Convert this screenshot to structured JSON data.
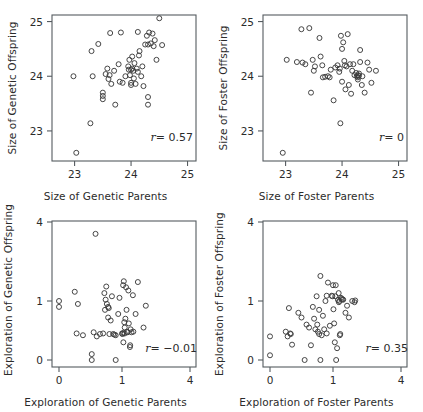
{
  "figure": {
    "kind": "scatterplot-matrix",
    "panel_count": 4,
    "marker": "open-circle",
    "marker_color": "#3c3c3c",
    "axis_color": "#555b60",
    "background": "#ffffff"
  },
  "chart_data": [
    {
      "id": "genetic-size",
      "position": "top-left",
      "type": "scatter",
      "title": "",
      "xlabel": "Size of Genetic Parents",
      "ylabel": "Size of Genetic Offspring",
      "annotation_r_symbol": "r",
      "annotation_r_value": "= 0.57",
      "r": 0.57,
      "grid": false,
      "legend": "none",
      "xticks": [
        23,
        24,
        25
      ],
      "yticks": [
        23,
        24,
        25
      ],
      "xlim": [
        22.6,
        25.15
      ],
      "ylim": [
        22.45,
        25.12
      ],
      "x_scale": "linear",
      "y_scale": "linear",
      "points": [
        [
          22.98,
          24.0
        ],
        [
          23.03,
          22.6
        ],
        [
          23.28,
          23.14
        ],
        [
          23.3,
          24.46
        ],
        [
          23.32,
          24.0
        ],
        [
          23.42,
          24.59
        ],
        [
          23.5,
          23.7
        ],
        [
          23.5,
          23.64
        ],
        [
          23.5,
          23.58
        ],
        [
          23.55,
          24.04
        ],
        [
          23.58,
          24.14
        ],
        [
          23.6,
          23.95
        ],
        [
          23.62,
          24.02
        ],
        [
          23.63,
          24.79
        ],
        [
          23.65,
          23.86
        ],
        [
          23.7,
          24.1
        ],
        [
          23.72,
          23.48
        ],
        [
          23.78,
          24.22
        ],
        [
          23.8,
          23.9
        ],
        [
          23.82,
          24.8
        ],
        [
          23.85,
          23.88
        ],
        [
          23.9,
          24.0
        ],
        [
          23.95,
          24.18
        ],
        [
          23.96,
          24.12
        ],
        [
          23.97,
          24.3
        ],
        [
          23.98,
          24.02
        ],
        [
          24.0,
          24.12
        ],
        [
          24.0,
          23.88
        ],
        [
          24.0,
          23.84
        ],
        [
          24.02,
          24.36
        ],
        [
          24.02,
          24.14
        ],
        [
          24.04,
          24.1
        ],
        [
          24.05,
          23.96
        ],
        [
          24.06,
          24.24
        ],
        [
          24.08,
          23.86
        ],
        [
          24.1,
          24.14
        ],
        [
          24.12,
          24.08
        ],
        [
          24.12,
          24.81
        ],
        [
          24.15,
          24.46
        ],
        [
          24.18,
          24.0
        ],
        [
          24.2,
          24.18
        ],
        [
          24.22,
          23.82
        ],
        [
          24.25,
          24.58
        ],
        [
          24.28,
          24.74
        ],
        [
          24.3,
          24.58
        ],
        [
          24.3,
          23.62
        ],
        [
          24.3,
          23.48
        ],
        [
          24.32,
          24.8
        ],
        [
          24.35,
          24.6
        ],
        [
          24.38,
          24.78
        ],
        [
          24.4,
          24.55
        ],
        [
          24.42,
          24.66
        ],
        [
          24.45,
          24.3
        ],
        [
          24.5,
          25.06
        ],
        [
          24.55,
          24.57
        ],
        [
          24.14,
          24.38
        ]
      ]
    },
    {
      "id": "foster-size",
      "position": "top-right",
      "type": "scatter",
      "title": "",
      "xlabel": "Size of Foster Parents",
      "ylabel": "Size of Foster Offspring",
      "annotation_r_symbol": "r",
      "annotation_r_value": "= 0",
      "r": 0.0,
      "grid": false,
      "legend": "none",
      "xticks": [
        23,
        24,
        25
      ],
      "yticks": [
        23,
        24,
        25
      ],
      "xlim": [
        22.6,
        25.15
      ],
      "ylim": [
        22.45,
        25.12
      ],
      "x_scale": "linear",
      "y_scale": "linear",
      "points": [
        [
          22.95,
          22.6
        ],
        [
          23.02,
          24.3
        ],
        [
          23.2,
          24.26
        ],
        [
          23.28,
          24.86
        ],
        [
          23.3,
          24.25
        ],
        [
          23.35,
          24.22
        ],
        [
          23.42,
          24.88
        ],
        [
          23.45,
          23.7
        ],
        [
          23.48,
          24.3
        ],
        [
          23.5,
          24.1
        ],
        [
          23.52,
          24.18
        ],
        [
          23.6,
          24.7
        ],
        [
          23.62,
          24.36
        ],
        [
          23.65,
          24.2
        ],
        [
          23.66,
          23.98
        ],
        [
          23.7,
          23.99
        ],
        [
          23.75,
          24.0
        ],
        [
          23.78,
          23.98
        ],
        [
          23.8,
          24.12
        ],
        [
          23.85,
          23.56
        ],
        [
          23.88,
          24.16
        ],
        [
          23.92,
          24.2
        ],
        [
          23.95,
          24.08
        ],
        [
          23.96,
          24.14
        ],
        [
          23.97,
          23.14
        ],
        [
          23.98,
          24.74
        ],
        [
          24.0,
          24.5
        ],
        [
          24.0,
          23.9
        ],
        [
          24.02,
          24.62
        ],
        [
          24.04,
          24.28
        ],
        [
          24.05,
          24.2
        ],
        [
          24.06,
          23.76
        ],
        [
          24.08,
          24.18
        ],
        [
          24.1,
          24.77
        ],
        [
          24.12,
          23.84
        ],
        [
          24.14,
          24.22
        ],
        [
          24.16,
          23.68
        ],
        [
          24.18,
          24.1
        ],
        [
          24.2,
          24.22
        ],
        [
          24.22,
          24.02
        ],
        [
          24.25,
          24.06
        ],
        [
          24.26,
          24.0
        ],
        [
          24.28,
          24.02
        ],
        [
          24.28,
          23.94
        ],
        [
          24.3,
          24.05
        ],
        [
          24.3,
          24.01
        ],
        [
          24.32,
          24.48
        ],
        [
          24.32,
          24.26
        ],
        [
          24.35,
          23.84
        ],
        [
          24.36,
          24.0
        ],
        [
          24.4,
          23.7
        ],
        [
          24.45,
          24.25
        ],
        [
          24.48,
          24.12
        ],
        [
          24.52,
          23.88
        ],
        [
          24.6,
          24.1
        ],
        [
          24.28,
          23.98
        ]
      ]
    },
    {
      "id": "genetic-exploration",
      "position": "bottom-left",
      "type": "scatter",
      "title": "",
      "xlabel": "Exploration of Genetic Parents",
      "ylabel": "Exploration of Genetic Offspring",
      "annotation_r_symbol": "r",
      "annotation_r_value": "= −0.01",
      "r": -0.01,
      "grid": false,
      "legend": "none",
      "xticks": [
        0,
        1,
        4
      ],
      "yticks": [
        0,
        1,
        4
      ],
      "xlim": [
        -0.12,
        4.35
      ],
      "ylim": [
        -0.12,
        4.3
      ],
      "x_scale": "sqrt-like",
      "y_scale": "sqrt-like",
      "points": [
        [
          0.0,
          1.0
        ],
        [
          0.0,
          0.9
        ],
        [
          0.25,
          1.35
        ],
        [
          0.3,
          0.95
        ],
        [
          0.28,
          0.45
        ],
        [
          0.38,
          0.42
        ],
        [
          0.52,
          0.1
        ],
        [
          0.52,
          0.0
        ],
        [
          0.55,
          0.47
        ],
        [
          0.58,
          3.55
        ],
        [
          0.6,
          0.4
        ],
        [
          0.65,
          0.44
        ],
        [
          0.7,
          0.45
        ],
        [
          0.72,
          1.3
        ],
        [
          0.74,
          1.05
        ],
        [
          0.75,
          1.55
        ],
        [
          0.76,
          0.95
        ],
        [
          0.78,
          0.9
        ],
        [
          0.78,
          0.72
        ],
        [
          0.8,
          0.44
        ],
        [
          0.82,
          0.67
        ],
        [
          0.84,
          1.18
        ],
        [
          0.86,
          0.44
        ],
        [
          0.88,
          0.43
        ],
        [
          0.9,
          0.42
        ],
        [
          0.9,
          0.0
        ],
        [
          0.94,
          0.78
        ],
        [
          0.96,
          1.12
        ],
        [
          1.0,
          0.45
        ],
        [
          1.02,
          0.44
        ],
        [
          1.05,
          1.6
        ],
        [
          1.06,
          0.3
        ],
        [
          1.08,
          1.75
        ],
        [
          1.1,
          0.64
        ],
        [
          1.12,
          0.55
        ],
        [
          1.15,
          0.7
        ],
        [
          1.18,
          1.52
        ],
        [
          1.2,
          0.85
        ],
        [
          1.22,
          0.48
        ],
        [
          1.25,
          0.47
        ],
        [
          1.28,
          1.4
        ],
        [
          1.3,
          0.62
        ],
        [
          1.35,
          0.22
        ],
        [
          1.36,
          0.25
        ],
        [
          1.38,
          0.52
        ],
        [
          1.42,
          0.47
        ],
        [
          1.48,
          1.22
        ],
        [
          1.5,
          0.48
        ],
        [
          1.6,
          0.78
        ],
        [
          1.7,
          1.72
        ],
        [
          1.95,
          0.55
        ],
        [
          2.05,
          0.92
        ],
        [
          0.73,
          0.85
        ],
        [
          0.79,
          0.88
        ],
        [
          1.12,
          0.45
        ],
        [
          1.06,
          0.46
        ]
      ]
    },
    {
      "id": "foster-exploration",
      "position": "bottom-right",
      "type": "scatter",
      "title": "",
      "xlabel": "Exploration of Foster Parents",
      "ylabel": "Exploration of Foster Offspring",
      "annotation_r_symbol": "r",
      "annotation_r_value": "= 0.35",
      "r": 0.35,
      "grid": false,
      "legend": "none",
      "xticks": [
        0,
        1,
        4
      ],
      "yticks": [
        0,
        1,
        4
      ],
      "xlim": [
        -0.12,
        4.35
      ],
      "ylim": [
        -0.12,
        4.3
      ],
      "x_scale": "sqrt-like",
      "y_scale": "sqrt-like",
      "points": [
        [
          0.0,
          0.4
        ],
        [
          0.0,
          0.08
        ],
        [
          0.25,
          0.48
        ],
        [
          0.28,
          0.4
        ],
        [
          0.3,
          0.88
        ],
        [
          0.32,
          0.45
        ],
        [
          0.33,
          0.44
        ],
        [
          0.35,
          0.26
        ],
        [
          0.45,
          0.8
        ],
        [
          0.5,
          0.72
        ],
        [
          0.55,
          0.0
        ],
        [
          0.58,
          0.6
        ],
        [
          0.62,
          0.55
        ],
        [
          0.65,
          0.25
        ],
        [
          0.68,
          0.9
        ],
        [
          0.7,
          0.7
        ],
        [
          0.72,
          0.52
        ],
        [
          0.74,
          1.18
        ],
        [
          0.75,
          0.6
        ],
        [
          0.76,
          0.48
        ],
        [
          0.78,
          0.85
        ],
        [
          0.78,
          0.44
        ],
        [
          0.8,
          1.95
        ],
        [
          0.8,
          0.0
        ],
        [
          0.82,
          0.42
        ],
        [
          0.84,
          0.75
        ],
        [
          0.86,
          0.52
        ],
        [
          0.88,
          1.0
        ],
        [
          0.9,
          0.45
        ],
        [
          0.92,
          1.7
        ],
        [
          0.95,
          0.58
        ],
        [
          0.98,
          1.2
        ],
        [
          0.99,
          1.18
        ],
        [
          1.0,
          1.6
        ],
        [
          1.02,
          0.86
        ],
        [
          1.05,
          0.62
        ],
        [
          1.08,
          0.3
        ],
        [
          1.1,
          1.18
        ],
        [
          1.12,
          1.6
        ],
        [
          1.14,
          0.0
        ],
        [
          1.18,
          0.2
        ],
        [
          1.22,
          1.04
        ],
        [
          1.25,
          1.3
        ],
        [
          1.26,
          0.98
        ],
        [
          1.28,
          1.0
        ],
        [
          1.3,
          0.42
        ],
        [
          1.32,
          0.44
        ],
        [
          1.35,
          1.12
        ],
        [
          1.38,
          1.08
        ],
        [
          1.42,
          1.06
        ],
        [
          1.45,
          1.05
        ],
        [
          1.55,
          0.8
        ],
        [
          1.62,
          0.92
        ],
        [
          1.7,
          0.72
        ],
        [
          1.85,
          1.0
        ],
        [
          1.95,
          0.98
        ],
        [
          1.98,
          1.02
        ],
        [
          0.9,
          1.2
        ]
      ]
    }
  ]
}
